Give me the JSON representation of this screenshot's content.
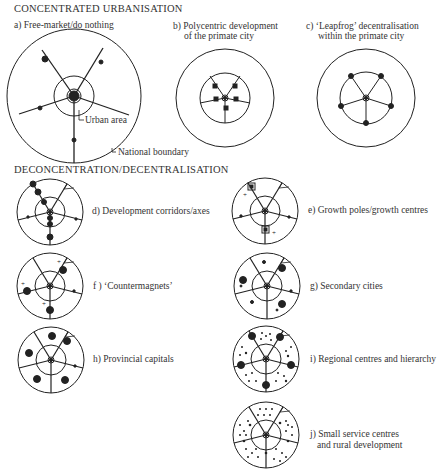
{
  "sections": {
    "concentrated": "CONCENTRATED URBANISATION",
    "deconcentration": "DECONCENTRATION/DECENTRALISATION"
  },
  "models": {
    "a": "a) Free-market/do nothing",
    "b1": "b) Polycentric development",
    "b2": "of the primate city",
    "c1": "c) ‘Leapfrog’ decentralisation",
    "c2": "within the primate city",
    "d": "d) Development corridors/axes",
    "e": "e) Growth poles/growth centres",
    "f": "f ) ‘Countermagnets’",
    "g": "g) Secondary cities",
    "h": "h) Provincial capitals",
    "i": "i) Regional centres and hierarchy",
    "j1": "j) Small service centres",
    "j2": "and rural development"
  },
  "annotations": {
    "urban_area": "Urban area",
    "national_boundary": "National boundary"
  },
  "colors": {
    "ink": "#222222",
    "background": "#ffffff"
  }
}
